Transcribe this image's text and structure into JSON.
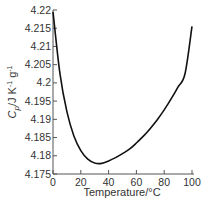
{
  "chart_data": {
    "type": "line",
    "title": "",
    "xlabel": "Temperature/°C",
    "ylabel": "Cp/J K-1 g-1",
    "ylabel_parts": {
      "main": "C",
      "sub": "p",
      "rest": "/J K",
      "sup1": "-1",
      "mid": " g",
      "sup2": "-1"
    },
    "xlim": [
      0,
      100
    ],
    "ylim": [
      4.175,
      4.22
    ],
    "x_ticks": [
      0,
      20,
      40,
      60,
      80,
      100
    ],
    "x_tick_labels": [
      "0",
      "20",
      "40",
      "60",
      "80",
      "100"
    ],
    "y_ticks": [
      4.175,
      4.18,
      4.185,
      4.19,
      4.195,
      4.2,
      4.205,
      4.21,
      4.215,
      4.22
    ],
    "y_tick_labels": [
      "4.175",
      "4.18",
      "4.185",
      "4.19",
      "4.195",
      "4.2",
      "4.205",
      "4.21",
      "4.215",
      "4.22"
    ],
    "grid": false,
    "legend": null,
    "series": [
      {
        "name": "Cp of water",
        "color": "#111111",
        "x": [
          0,
          5,
          10,
          15,
          20,
          25,
          30,
          35,
          40,
          45,
          50,
          55,
          60,
          65,
          70,
          75,
          80,
          85,
          90,
          95,
          100
        ],
        "y": [
          4.2195,
          4.2025,
          4.1921,
          4.1855,
          4.1814,
          4.1791,
          4.178,
          4.1779,
          4.1786,
          4.1795,
          4.1806,
          4.1818,
          4.1835,
          4.1854,
          4.1875,
          4.1899,
          4.1926,
          4.1956,
          4.1989,
          4.2025,
          4.2155
        ]
      }
    ]
  }
}
